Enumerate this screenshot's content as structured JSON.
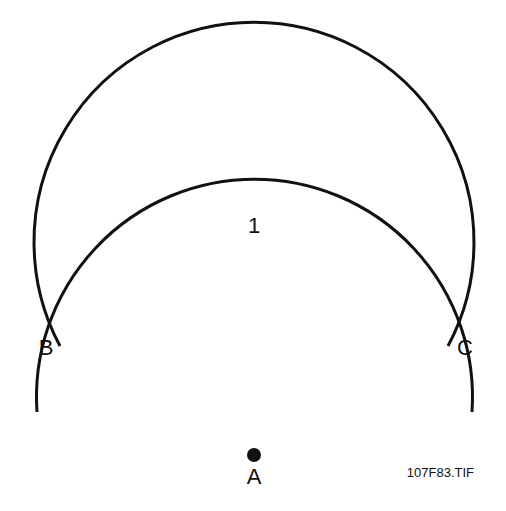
{
  "diagram": {
    "arcs": [
      {
        "name": "large-circle-arc",
        "cx": 254,
        "cy": 255,
        "r": 220,
        "from": "B",
        "to": "C",
        "via": "top"
      },
      {
        "name": "small-arc",
        "cx": 254,
        "cy": 347,
        "r": 218,
        "start": [
          37,
          412
        ],
        "end": [
          472,
          412
        ]
      }
    ],
    "points": {
      "A": {
        "label": "A",
        "x": 254,
        "y": 455
      },
      "B": {
        "label": "B",
        "x": 60,
        "y": 346
      },
      "C": {
        "label": "C",
        "x": 448,
        "y": 346
      }
    },
    "arc_label": "1",
    "caption": "107F83.TIF",
    "stroke_color": "#111111"
  }
}
